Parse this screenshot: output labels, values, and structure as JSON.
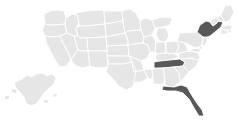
{
  "map": {
    "title": "United States choropleth map",
    "projection": "albers-usa",
    "background_color": "#ffffff",
    "border_color": "#ffffff",
    "default_state_color": "#e6e6e6",
    "highlight_state_color": "#585858",
    "highlighted_states": [
      "New York",
      "Tennessee",
      "Florida"
    ],
    "includes_alaska": true,
    "includes_hawaii": false,
    "legend_visible": false,
    "labels_visible": false,
    "states": [
      {
        "id": "WA",
        "name": "Washington",
        "highlighted": false
      },
      {
        "id": "OR",
        "name": "Oregon",
        "highlighted": false
      },
      {
        "id": "CA",
        "name": "California",
        "highlighted": false
      },
      {
        "id": "NV",
        "name": "Nevada",
        "highlighted": false
      },
      {
        "id": "ID",
        "name": "Idaho",
        "highlighted": false
      },
      {
        "id": "MT",
        "name": "Montana",
        "highlighted": false
      },
      {
        "id": "WY",
        "name": "Wyoming",
        "highlighted": false
      },
      {
        "id": "UT",
        "name": "Utah",
        "highlighted": false
      },
      {
        "id": "AZ",
        "name": "Arizona",
        "highlighted": false
      },
      {
        "id": "CO",
        "name": "Colorado",
        "highlighted": false
      },
      {
        "id": "NM",
        "name": "New Mexico",
        "highlighted": false
      },
      {
        "id": "ND",
        "name": "North Dakota",
        "highlighted": false
      },
      {
        "id": "SD",
        "name": "South Dakota",
        "highlighted": false
      },
      {
        "id": "NE",
        "name": "Nebraska",
        "highlighted": false
      },
      {
        "id": "KS",
        "name": "Kansas",
        "highlighted": false
      },
      {
        "id": "OK",
        "name": "Oklahoma",
        "highlighted": false
      },
      {
        "id": "TX",
        "name": "Texas",
        "highlighted": false
      },
      {
        "id": "MN",
        "name": "Minnesota",
        "highlighted": false
      },
      {
        "id": "IA",
        "name": "Iowa",
        "highlighted": false
      },
      {
        "id": "MO",
        "name": "Missouri",
        "highlighted": false
      },
      {
        "id": "AR",
        "name": "Arkansas",
        "highlighted": false
      },
      {
        "id": "LA",
        "name": "Louisiana",
        "highlighted": false
      },
      {
        "id": "WI",
        "name": "Wisconsin",
        "highlighted": false
      },
      {
        "id": "IL",
        "name": "Illinois",
        "highlighted": false
      },
      {
        "id": "MS",
        "name": "Mississippi",
        "highlighted": false
      },
      {
        "id": "MI",
        "name": "Michigan",
        "highlighted": false
      },
      {
        "id": "IN",
        "name": "Indiana",
        "highlighted": false
      },
      {
        "id": "OH",
        "name": "Ohio",
        "highlighted": false
      },
      {
        "id": "KY",
        "name": "Kentucky",
        "highlighted": false
      },
      {
        "id": "TN",
        "name": "Tennessee",
        "highlighted": true
      },
      {
        "id": "AL",
        "name": "Alabama",
        "highlighted": false
      },
      {
        "id": "GA",
        "name": "Georgia",
        "highlighted": false
      },
      {
        "id": "FL",
        "name": "Florida",
        "highlighted": true
      },
      {
        "id": "SC",
        "name": "South Carolina",
        "highlighted": false
      },
      {
        "id": "NC",
        "name": "North Carolina",
        "highlighted": false
      },
      {
        "id": "VA",
        "name": "Virginia",
        "highlighted": false
      },
      {
        "id": "WV",
        "name": "West Virginia",
        "highlighted": false
      },
      {
        "id": "MD",
        "name": "Maryland",
        "highlighted": false
      },
      {
        "id": "DE",
        "name": "Delaware",
        "highlighted": false
      },
      {
        "id": "PA",
        "name": "Pennsylvania",
        "highlighted": false
      },
      {
        "id": "NJ",
        "name": "New Jersey",
        "highlighted": false
      },
      {
        "id": "NY",
        "name": "New York",
        "highlighted": true
      },
      {
        "id": "CT",
        "name": "Connecticut",
        "highlighted": false
      },
      {
        "id": "RI",
        "name": "Rhode Island",
        "highlighted": false
      },
      {
        "id": "MA",
        "name": "Massachusetts",
        "highlighted": false
      },
      {
        "id": "VT",
        "name": "Vermont",
        "highlighted": false
      },
      {
        "id": "NH",
        "name": "New Hampshire",
        "highlighted": false
      },
      {
        "id": "ME",
        "name": "Maine",
        "highlighted": false
      },
      {
        "id": "AK",
        "name": "Alaska",
        "highlighted": false
      }
    ]
  }
}
